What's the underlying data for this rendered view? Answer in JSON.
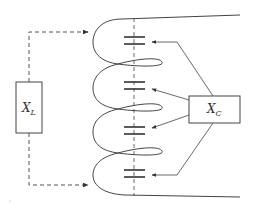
{
  "diagram": {
    "type": "circuit-schematic",
    "inductor_box": {
      "label": "X",
      "subscript": "L"
    },
    "capacitor_box": {
      "label": "X",
      "subscript": "C"
    },
    "capacitor_count": 4,
    "colors": {
      "stroke": "#444444",
      "background": "#ffffff"
    }
  }
}
